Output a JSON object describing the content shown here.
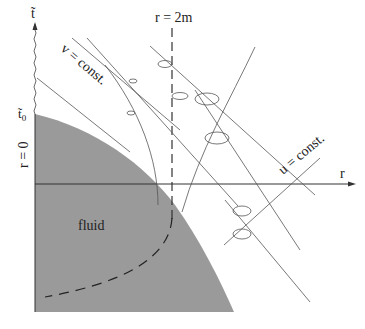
{
  "figure": {
    "type": "spacetime-diagram",
    "labels": {
      "t_axis": "t̃",
      "t0": "t̃",
      "t0_sub": "0",
      "r_axis": "r",
      "r_zero": "r = 0",
      "horizon": "r = 2m",
      "v_const": "v = const.",
      "u_const": "u = const.",
      "fluid": "fluid"
    },
    "colors": {
      "fluid_fill": "#9a9a9a",
      "line": "#444444",
      "background": "#ffffff"
    }
  }
}
